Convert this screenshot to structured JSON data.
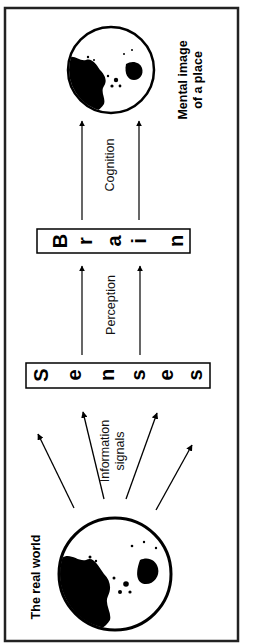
{
  "diagram": {
    "labels": {
      "real_world": "The real world",
      "information_line1": "Information",
      "information_line2": "signals",
      "perception": "Perception",
      "cognition": "Cognition",
      "mental_line1": "Mental image",
      "mental_line2": "of a place"
    },
    "senses_box": {
      "word": "Senses",
      "letters": [
        "S",
        "e",
        "n",
        "s",
        "e",
        "s"
      ]
    },
    "brain_box": {
      "word": "Brain",
      "letters": [
        "B",
        "r",
        "a",
        "i",
        "n"
      ]
    },
    "colors": {
      "ink": "#000000",
      "background": "#ffffff",
      "frame": "#222222"
    }
  }
}
